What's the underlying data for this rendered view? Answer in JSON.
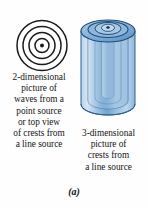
{
  "figure": {
    "panel_label": "(a)",
    "background_color": "#fefefe",
    "ink_color": "#151515"
  },
  "left_diagram": {
    "name": "concentric-circles-wavefronts",
    "description": "2-dimensional picture of waves from a point source",
    "ring_count": 4,
    "has_center_dot": true,
    "stroke_color": "#1a1a1a"
  },
  "right_diagram": {
    "name": "nested-cylinder-wavefronts",
    "description": "3-dimensional picture of crests from a line source",
    "nested_shell_count": 4,
    "fill_color_light": "#cfe2f3",
    "fill_color_mid": "#7fb0dc",
    "fill_color_dark": "#4b87c0",
    "stroke_color": "#1f4e79"
  },
  "caption_2d": {
    "lines": [
      "2-dimensional",
      "picture of",
      "waves from a",
      "point source",
      "or top view",
      "of crests from",
      "a line source"
    ]
  },
  "caption_3d": {
    "lines": [
      "3-dimensional",
      "picture of",
      "crests from",
      "a line source"
    ]
  }
}
